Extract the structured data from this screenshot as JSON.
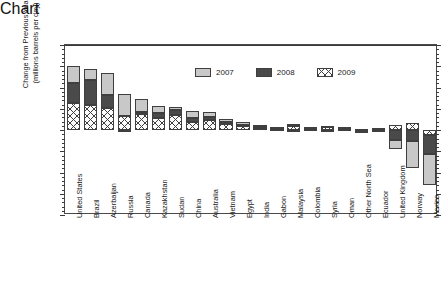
{
  "chart_data": {
    "type": "bar",
    "subtype": "stacked-bar",
    "title": "",
    "xlabel": "",
    "ylabel": "Change from Previous Year (millions barrels per day)",
    "ylabel_line1": "Change from Previous Year",
    "ylabel_line2": "(millions barrels per day)",
    "ylim": [
      -0.8,
      0.8
    ],
    "yticks": [
      0.8,
      0.6,
      0.4,
      0.2,
      0.0,
      -0.2,
      -0.4,
      -0.6,
      -0.8
    ],
    "ytick_labels": [
      "0.8",
      "0.6",
      "0.4",
      "0.2",
      "0.0",
      "-0.2",
      "-0.4",
      "-0.6",
      "-0.8"
    ],
    "grid": false,
    "legend_position": "top-center-inside",
    "categories": [
      "United States",
      "Brazil",
      "Azerbaijan",
      "Russia",
      "Canada",
      "Kazakhstan",
      "Sudan",
      "China",
      "Australia",
      "Vietnam",
      "Egypt",
      "India",
      "Gabon",
      "Malaysia",
      "Colombia",
      "Syria",
      "Oman",
      "Other North Sea",
      "Ecuador",
      "United Kingdom",
      "Norway",
      "Mexico"
    ],
    "series": [
      {
        "name": "2007",
        "color": "#c8c8c8",
        "pattern": "solid-light-gray",
        "values": [
          0.16,
          0.1,
          0.21,
          0.21,
          0.12,
          0.07,
          0.03,
          0.07,
          0.05,
          0.02,
          0.03,
          0.02,
          0.01,
          -0.02,
          0.01,
          -0.01,
          0.0,
          -0.02,
          -0.02,
          -0.09,
          -0.26,
          -0.29
        ]
      },
      {
        "name": "2008",
        "color": "#4a4a4a",
        "pattern": "solid-dark-gray",
        "values": [
          0.19,
          0.23,
          0.12,
          -0.02,
          0.02,
          0.05,
          0.05,
          0.03,
          0.03,
          0.02,
          0.01,
          0.01,
          0.01,
          0.02,
          0.01,
          0.01,
          0.02,
          -0.01,
          0.0,
          -0.09,
          -0.1,
          -0.18
        ]
      },
      {
        "name": "2009",
        "color": "#fbfbfb",
        "pattern": "cross-hatch",
        "values": [
          0.25,
          0.24,
          0.21,
          0.13,
          0.15,
          0.11,
          0.14,
          0.08,
          0.09,
          0.06,
          0.04,
          0.02,
          0.01,
          0.04,
          0.01,
          0.03,
          0.01,
          0.01,
          0.02,
          0.05,
          0.07,
          -0.05
        ]
      }
    ]
  },
  "legend": {
    "items": [
      {
        "label": "2007"
      },
      {
        "label": "2008"
      },
      {
        "label": "2009"
      }
    ]
  }
}
